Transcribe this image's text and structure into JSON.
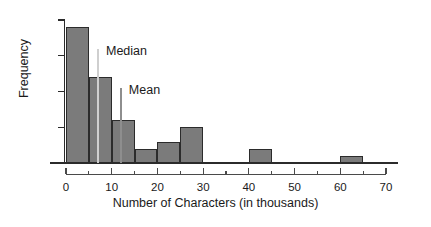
{
  "chart_data": {
    "type": "bar",
    "title": "",
    "subtitle": "",
    "xlabel": "Number of Characters (in thousands)",
    "ylabel": "Frequency",
    "xlim": [
      0,
      70
    ],
    "ylim": [
      0,
      20
    ],
    "grid": false,
    "legend": "none",
    "bin_width": 5,
    "categories": [
      "0-5",
      "5-10",
      "10-15",
      "15-20",
      "20-25",
      "25-30",
      "30-35",
      "35-40",
      "40-45",
      "45-50",
      "50-55",
      "55-60",
      "60-65"
    ],
    "bin_edges": [
      0,
      5,
      10,
      15,
      20,
      25,
      30,
      35,
      40,
      45,
      50,
      55,
      60,
      65
    ],
    "values": [
      19,
      12,
      6,
      2,
      3,
      5,
      0,
      0,
      2,
      0,
      0,
      0,
      1
    ],
    "x_ticks_major": [
      0,
      10,
      20,
      30,
      40,
      50,
      60,
      70
    ],
    "x_tick_labels": [
      "0",
      "10",
      "20",
      "30",
      "40",
      "50",
      "60",
      "70"
    ],
    "x_ticks_minor": [
      5,
      15,
      25,
      35,
      45,
      55,
      65
    ],
    "y_ticks": [
      0,
      5,
      10,
      15,
      20
    ],
    "y_tick_labels": [
      "0",
      "5",
      "10",
      "15",
      "20"
    ],
    "annotations": [
      {
        "name": "median",
        "label": "Median",
        "x": 7,
        "y_top": 16,
        "color": "#cfcfcf"
      },
      {
        "name": "mean",
        "label": "Mean",
        "x": 12,
        "y_top": 10.5,
        "color": "#8e8e8e"
      }
    ],
    "colors": {
      "bar_fill": "#7b7b7b",
      "bar_edge": "#2b2b2b",
      "axis": "#2b2b2b",
      "text": "#1a1a1a",
      "median_line": "#cfcfcf",
      "mean_line": "#8e8e8e",
      "background": "#ffffff"
    }
  },
  "axes": {
    "y_title": "Frequency",
    "x_title": "Number of Characters (in thousands)"
  }
}
